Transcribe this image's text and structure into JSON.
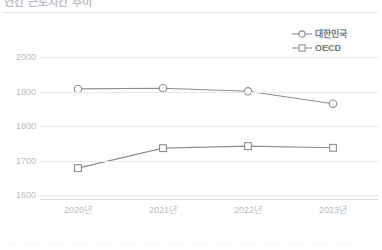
{
  "chart_data": {
    "type": "line",
    "title": "연간 근로시간 추이",
    "xlabel": "",
    "ylabel": "",
    "categories": [
      "2020년",
      "2021년",
      "2022년",
      "2023년"
    ],
    "ylim": [
      1600,
      2050
    ],
    "yticks": [
      1600,
      1700,
      1800,
      1900,
      2000
    ],
    "ytick_labels": [
      "1600",
      "1700",
      "1800",
      "1900",
      "2000"
    ],
    "grid": true,
    "legend_position": "top-right",
    "series": [
      {
        "name": "대한민국",
        "marker": "circle",
        "color": "#8a8f94",
        "values": [
          1908,
          1910,
          1901,
          1865
        ]
      },
      {
        "name": "OECD",
        "marker": "square",
        "color": "#8a8f94",
        "values": [
          1678,
          1736,
          1742,
          1737
        ]
      }
    ]
  },
  "legend": {
    "items": [
      {
        "label": "대한민국",
        "marker": "circle-marker-icon"
      },
      {
        "label": "OECD",
        "marker": "square-marker-icon"
      }
    ]
  },
  "colors": {
    "line": "#8a8f94",
    "gridline": "#e8e8e8",
    "axis": "#d8dadd",
    "tick_text": "#b9bcc0",
    "legend_text": "#74797e",
    "title_text": "#bcc0c4",
    "background": "#ffffff"
  }
}
